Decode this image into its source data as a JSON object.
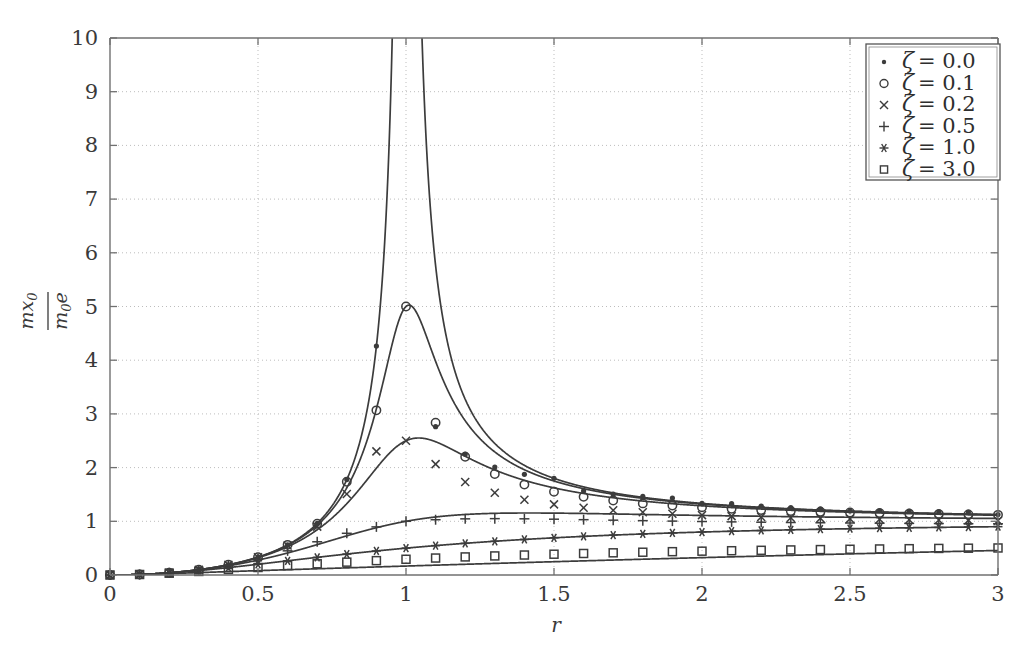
{
  "chart_data": {
    "type": "line",
    "title": "",
    "xlabel": "r",
    "ylabel_numerator": "mx0",
    "ylabel_denominator": "m0e",
    "ylabel": "mx0 / m0e",
    "xlim": [
      0,
      3
    ],
    "ylim": [
      0,
      10
    ],
    "xticks": [
      0,
      0.5,
      1,
      1.5,
      2,
      2.5,
      3
    ],
    "xtick_labels": [
      "0",
      "0.5",
      "1",
      "1.5",
      "2",
      "2.5",
      "3"
    ],
    "yticks": [
      0,
      1,
      2,
      3,
      4,
      5,
      6,
      7,
      8,
      9,
      10
    ],
    "ytick_labels": [
      "0",
      "1",
      "2",
      "3",
      "4",
      "5",
      "6",
      "7",
      "8",
      "9",
      "10"
    ],
    "grid": true,
    "grid_style": "dotted",
    "legend_position": "top-right",
    "line_color": "#3c3c3c",
    "grid_color": "#bdbdbd",
    "axis_color": "#707070",
    "formula": "r^2 / sqrt((1-r^2)^2 + (2*zeta*r)^2)",
    "marker_step": 0.1,
    "x": [
      0,
      0.1,
      0.2,
      0.3,
      0.4,
      0.5,
      0.6,
      0.7,
      0.8,
      0.9,
      1.0,
      1.1,
      1.2,
      1.3,
      1.4,
      1.5,
      1.6,
      1.7,
      1.8,
      1.9,
      2.0,
      2.1,
      2.2,
      2.3,
      2.4,
      2.5,
      2.6,
      2.7,
      2.8,
      2.9,
      3.0
    ],
    "series": [
      {
        "name": "zeta = 0.0",
        "zeta": 0.0,
        "marker": "dot",
        "values": [
          0,
          0.0101,
          0.0417,
          0.0989,
          0.1905,
          0.3333,
          0.5625,
          0.9608,
          1.7778,
          4.2632,
          null,
          2.7619,
          2.25,
          2.0093,
          1.875,
          1.8,
          1.5686,
          1.5053,
          1.4634,
          1.4339,
          1.3333,
          1.3289,
          1.2826,
          1.2533,
          1.2329,
          1.1905,
          1.2003,
          1.1885,
          1.1797,
          1.1729,
          1.125
        ]
      },
      {
        "name": "zeta = 0.1",
        "zeta": 0.1,
        "marker": "circle",
        "values": [
          0,
          0.0101,
          0.0417,
          0.0988,
          0.1903,
          0.3328,
          0.561,
          0.9542,
          1.7374,
          3.0657,
          5.0,
          2.8352,
          2.2013,
          1.8821,
          1.683,
          1.5495,
          1.4553,
          1.3861,
          1.3335,
          1.2925,
          1.2599,
          1.2334,
          1.2115,
          1.1931,
          1.1776,
          1.1644,
          1.1529,
          1.143,
          1.1343,
          1.1267,
          1.1199
        ]
      },
      {
        "name": "zeta = 0.2",
        "zeta": 0.2,
        "marker": "x",
        "values": [
          0,
          0.0101,
          0.0416,
          0.0984,
          0.1891,
          0.3288,
          0.5476,
          0.9014,
          1.5098,
          2.3024,
          2.5,
          2.0647,
          1.7316,
          1.5306,
          1.4025,
          1.3148,
          1.2516,
          1.2043,
          1.1678,
          1.1389,
          1.1155,
          1.0964,
          1.0804,
          1.0669,
          1.0554,
          1.0455,
          1.0369,
          1.0295,
          1.0229,
          1.0171,
          1.012
        ]
      },
      {
        "name": "zeta = 0.5",
        "zeta": 0.5,
        "marker": "plus",
        "values": [
          0,
          0.0101,
          0.041,
          0.0953,
          0.1791,
          0.2981,
          0.45,
          0.6186,
          0.7767,
          0.8961,
          1.0,
          1.0293,
          1.0456,
          1.0496,
          1.0463,
          1.0392,
          1.0303,
          1.021,
          1.012,
          1.0036,
          0.996,
          0.9891,
          0.983,
          0.9775,
          0.9727,
          0.9684,
          0.9646,
          0.9612,
          0.9582,
          0.9554,
          0.953
        ]
      },
      {
        "name": "zeta = 1.0",
        "zeta": 1.0,
        "marker": "asterisk",
        "values": [
          0,
          0.0099,
          0.0385,
          0.0826,
          0.1379,
          0.2,
          0.2647,
          0.329,
          0.3902,
          0.4474,
          0.5,
          0.5475,
          0.5902,
          0.6283,
          0.6622,
          0.6923,
          0.7191,
          0.743,
          0.7642,
          0.7833,
          0.8,
          0.8154,
          0.8292,
          0.8416,
          0.8529,
          0.8621,
          0.8716,
          0.8795,
          0.8868,
          0.8935,
          0.9
        ]
      },
      {
        "name": "zeta = 3.0",
        "zeta": 3.0,
        "marker": "square",
        "values": [
          0,
          0.0094,
          0.0335,
          0.0664,
          0.1031,
          0.14,
          0.1754,
          0.2086,
          0.2393,
          0.2675,
          0.2929,
          0.3159,
          0.3366,
          0.3552,
          0.372,
          0.3871,
          0.4007,
          0.413,
          0.4242,
          0.4344,
          0.4436,
          0.4521,
          0.4598,
          0.4669,
          0.4734,
          0.4794,
          0.4849,
          0.49,
          0.4948,
          0.4992,
          0.5033
        ]
      }
    ]
  },
  "legend": {
    "entries": [
      {
        "marker": "dot",
        "label": "ζ = 0.0",
        "zeta_symbol": "ζ",
        "equals_value": "= 0.0"
      },
      {
        "marker": "circle",
        "label": "ζ = 0.1",
        "zeta_symbol": "ζ",
        "equals_value": "= 0.1"
      },
      {
        "marker": "x",
        "label": "ζ = 0.2",
        "zeta_symbol": "ζ",
        "equals_value": "= 0.2"
      },
      {
        "marker": "plus",
        "label": "ζ = 0.5",
        "zeta_symbol": "ζ",
        "equals_value": "= 0.5"
      },
      {
        "marker": "asterisk",
        "label": "ζ = 1.0",
        "zeta_symbol": "ζ",
        "equals_value": "= 1.0"
      },
      {
        "marker": "square",
        "label": "ζ = 3.0",
        "zeta_symbol": "ζ",
        "equals_value": "= 3.0"
      }
    ]
  },
  "axis_labels": {
    "x": "r",
    "y_num_m": "m",
    "y_num_x": "x",
    "y_num_sub": "0",
    "y_den_m": "m",
    "y_den_sub": "0",
    "y_den_e": "e"
  }
}
